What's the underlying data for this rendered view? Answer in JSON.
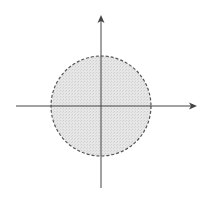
{
  "diagram": {
    "colors": {
      "fill": "#e2e2e2",
      "stroke": "#555555",
      "axis": "#444444",
      "background": "#ffffff"
    },
    "circle": {
      "cx": 101,
      "cy": 106,
      "r": 50
    },
    "x_axis": {
      "x1": 16,
      "x2": 197,
      "y": 106
    },
    "y_axis": {
      "x": 101,
      "y1": 188,
      "y2": 15
    }
  }
}
